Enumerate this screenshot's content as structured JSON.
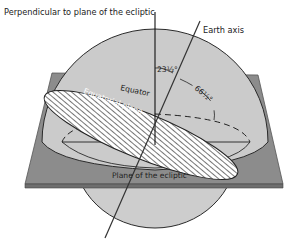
{
  "diagram": {
    "labels": {
      "perpendicular": "Perpendicular to plane of the ecliptic",
      "earth_axis": "Earth axis",
      "angle_small": "23½°",
      "angle_large": "66½°",
      "equator": "Equator",
      "equatorial_plane": "Equatorial plane",
      "plane_of_ecliptic": "Plane of the ecliptic"
    },
    "colors": {
      "sphere_fill": "#c9c9c9",
      "plane_fill": "#8a8a8a",
      "plane_edge": "#6b6b6b",
      "line": "#1e1e1e",
      "hatch_bg": "#ffffff"
    }
  }
}
